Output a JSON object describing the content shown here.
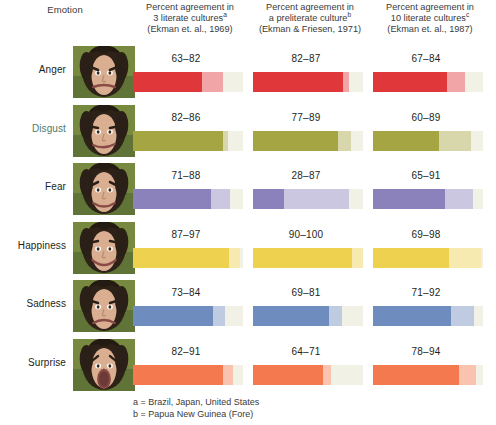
{
  "header": {
    "emotion_label": "Emotion",
    "columns": [
      {
        "line1": "Percent agreement in",
        "line2": "3 literate cultures",
        "sup": "a",
        "line3": "(Ekman et. al., 1969)"
      },
      {
        "line1": "Percent agreement in",
        "line2": "a preliterate culture",
        "sup": "b",
        "line3": "(Ekman & Friesen, 1971)"
      },
      {
        "line1": "Percent agreement in",
        "line2": "10 literate cultures",
        "sup": "c",
        "line3": "(Ekman et. al., 1987)"
      }
    ]
  },
  "footnotes": [
    "a = Brazil, Japan, United States",
    "b = Papua New Guinea (Fore)"
  ],
  "rows": [
    {
      "emotion": "Anger",
      "label_tinted": false,
      "values": [
        "63–82",
        "82–87",
        "67–84"
      ]
    },
    {
      "emotion": "Disgust",
      "label_tinted": true,
      "values": [
        "82–86",
        "77–89",
        "60–89"
      ]
    },
    {
      "emotion": "Fear",
      "label_tinted": false,
      "values": [
        "71–88",
        "28–87",
        "65–91"
      ]
    },
    {
      "emotion": "Happiness",
      "label_tinted": false,
      "values": [
        "87–97",
        "90–100",
        "69–98"
      ]
    },
    {
      "emotion": "Sadness",
      "label_tinted": false,
      "values": [
        "73–84",
        "69–81",
        "71–92"
      ]
    },
    {
      "emotion": "Surprise",
      "label_tinted": false,
      "values": [
        "82–91",
        "64–71",
        "78–94"
      ]
    }
  ],
  "colors": {
    "anger": "#e0383a",
    "disgust": "#a5a544",
    "fear": "#8b82bb",
    "happiness": "#edd14f",
    "sadness": "#6e8cbd",
    "surprise": "#f4794f",
    "pale_end": "#f2f1e6",
    "label_tint": "#4e7a6a",
    "text": "#231f20"
  },
  "chart_data": {
    "type": "bar",
    "xlabel": "",
    "ylabel": "Emotion",
    "xlim": [
      0,
      100
    ],
    "grid": false,
    "legend": "none",
    "categories": [
      "Anger",
      "Disgust",
      "Fear",
      "Happiness",
      "Sadness",
      "Surprise"
    ],
    "series": [
      {
        "name": "Percent agreement in 3 literate cultures (Ekman et. al., 1969)",
        "footnote": "a",
        "ranges": [
          [
            63,
            82
          ],
          [
            82,
            86
          ],
          [
            71,
            88
          ],
          [
            87,
            97
          ],
          [
            73,
            84
          ],
          [
            82,
            91
          ]
        ],
        "labels": [
          "63–82",
          "82–86",
          "71–88",
          "87–97",
          "73–84",
          "82–91"
        ]
      },
      {
        "name": "Percent agreement in a preliterate culture (Ekman & Friesen, 1971)",
        "footnote": "b",
        "ranges": [
          [
            82,
            87
          ],
          [
            77,
            89
          ],
          [
            28,
            87
          ],
          [
            90,
            100
          ],
          [
            69,
            81
          ],
          [
            64,
            71
          ]
        ],
        "labels": [
          "82–87",
          "77–89",
          "28–87",
          "90–100",
          "69–81",
          "64–71"
        ]
      },
      {
        "name": "Percent agreement in 10 literate cultures (Ekman et. al., 1987)",
        "footnote": "c",
        "ranges": [
          [
            67,
            84
          ],
          [
            60,
            89
          ],
          [
            65,
            91
          ],
          [
            69,
            98
          ],
          [
            71,
            92
          ],
          [
            78,
            94
          ]
        ],
        "labels": [
          "67–84",
          "60–89",
          "65–91",
          "69–98",
          "71–92",
          "78–94"
        ]
      }
    ],
    "series_colors": [
      "#e0383a",
      "#a5a544",
      "#8b82bb",
      "#edd14f",
      "#6e8cbd",
      "#f4794f"
    ],
    "notes": [
      "a = Brazil, Japan, United States",
      "b = Papua New Guinea (Fore)"
    ]
  }
}
